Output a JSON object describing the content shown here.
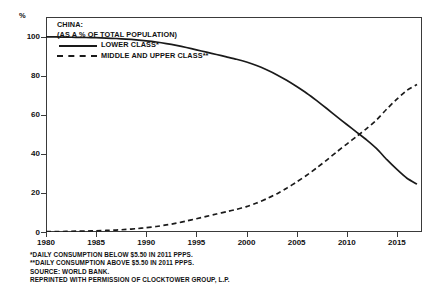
{
  "axes": {
    "y_unit_label": "%",
    "y_ticks": [
      {
        "label": "100",
        "value": 100
      },
      {
        "label": "80",
        "value": 80
      },
      {
        "label": "60",
        "value": 60
      },
      {
        "label": "40",
        "value": 40
      },
      {
        "label": "20",
        "value": 20
      },
      {
        "label": "0",
        "value": 0
      }
    ],
    "x_ticks": [
      {
        "label": "1980",
        "value": 1980
      },
      {
        "label": "1985",
        "value": 1985
      },
      {
        "label": "1990",
        "value": 1990
      },
      {
        "label": "1995",
        "value": 1995
      },
      {
        "label": "2000",
        "value": 2000
      },
      {
        "label": "2005",
        "value": 2005
      },
      {
        "label": "2010",
        "value": 2010
      },
      {
        "label": "2015",
        "value": 2015
      }
    ]
  },
  "legend": {
    "title_line_1": "CHINA:",
    "title_line_2": "(AS A % OF TOTAL POPULATION)",
    "entries": [
      {
        "label": "LOWER CLASS*",
        "style": "solid"
      },
      {
        "label": "MIDDLE AND UPPER CLASS**",
        "style": "dashed"
      }
    ]
  },
  "footnotes": [
    "*DAILY CONSUMPTION BELOW $5.50 IN 2011 PPPS.",
    "**DAILY CONSUMPTION ABOVE $5.50 IN 2011 PPPS.",
    "SOURCE: WORLD BANK.",
    "REPRINTED WITH PERMISSION OF CLOCKTOWER GROUP, L.P."
  ],
  "chart_data": {
    "type": "line",
    "title": "CHINA: (AS A % OF TOTAL POPULATION)",
    "xlabel": "",
    "ylabel": "%",
    "xlim": [
      1980,
      2017.5
    ],
    "ylim": [
      0,
      110
    ],
    "grid": false,
    "legend_position": "top-left",
    "x": [
      1980,
      1981,
      1982,
      1983,
      1984,
      1985,
      1986,
      1987,
      1988,
      1989,
      1990,
      1991,
      1992,
      1993,
      1994,
      1995,
      1996,
      1997,
      1998,
      1999,
      2000,
      2001,
      2002,
      2003,
      2004,
      2005,
      2006,
      2007,
      2008,
      2009,
      2010,
      2011,
      2012,
      2013,
      2014,
      2015,
      2016,
      2017
    ],
    "series": [
      {
        "name": "LOWER CLASS*",
        "style": "solid",
        "color": "#1a1a1a",
        "values": [
          99.8,
          99.8,
          99.7,
          99.6,
          99.5,
          99.4,
          99.2,
          99.0,
          98.7,
          98.3,
          97.8,
          97.2,
          96.4,
          95.5,
          94.4,
          93.2,
          92.0,
          90.8,
          89.6,
          88.4,
          87.0,
          85.2,
          83.0,
          80.5,
          77.6,
          74.4,
          71.0,
          67.2,
          63.2,
          59.0,
          55.0,
          51.0,
          47.0,
          42.5,
          37.0,
          32.0,
          27.5,
          24.5
        ]
      },
      {
        "name": "MIDDLE AND UPPER CLASS**",
        "style": "dashed",
        "color": "#1a1a1a",
        "values": [
          0.2,
          0.2,
          0.3,
          0.4,
          0.5,
          0.6,
          0.8,
          1.0,
          1.3,
          1.7,
          2.2,
          2.8,
          3.6,
          4.5,
          5.6,
          6.8,
          8.0,
          9.2,
          10.4,
          11.6,
          13.0,
          14.8,
          17.0,
          19.5,
          22.4,
          25.6,
          29.0,
          32.8,
          36.8,
          41.0,
          45.0,
          49.0,
          53.0,
          57.5,
          63.0,
          68.0,
          72.5,
          75.5
        ]
      }
    ]
  }
}
